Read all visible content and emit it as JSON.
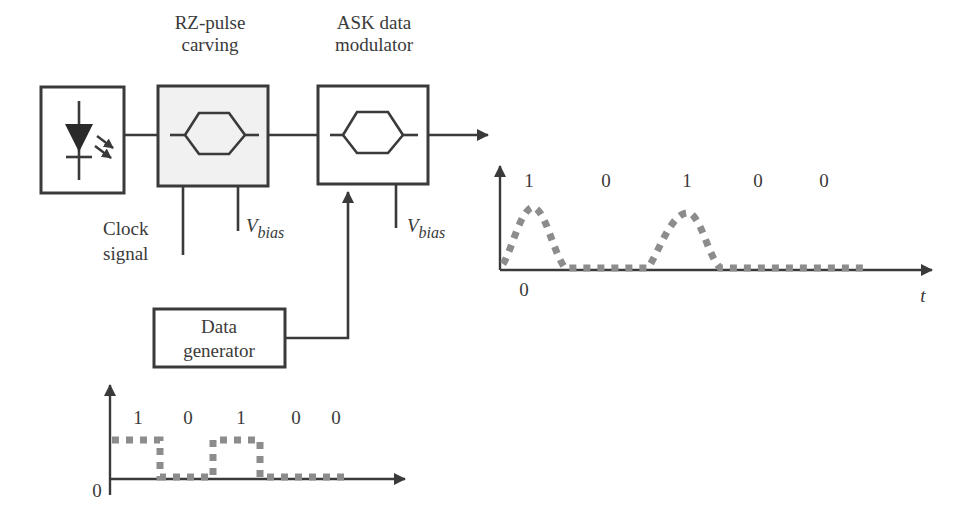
{
  "diagram": {
    "title_blocks": {
      "laser": {
        "label": ""
      },
      "rz_pulse_carver": {
        "label_line1": "RZ-pulse",
        "label_line2": "carving"
      },
      "ask_modulator": {
        "label_line1": "ASK data",
        "label_line2": "modulator"
      },
      "data_generator": {
        "label_line1": "Data",
        "label_line2": "generator"
      }
    },
    "inputs": {
      "clock_signal": {
        "line1": "Clock",
        "line2": "signal"
      },
      "vbias_1": {
        "main": "V",
        "sub": "bias"
      },
      "vbias_2": {
        "main": "V",
        "sub": "bias"
      }
    },
    "output_plot": {
      "bits": [
        "1",
        "0",
        "1",
        "0",
        "0"
      ],
      "origin_label": "0",
      "x_axis_label": "t"
    },
    "input_plot": {
      "bits": [
        "1",
        "0",
        "1",
        "0",
        "0"
      ],
      "origin_label": "0"
    },
    "colors": {
      "line": "#3a3a3a",
      "box_fill_shaded": "#f1f1f1",
      "signal_dots": "#8c8c8c"
    }
  }
}
